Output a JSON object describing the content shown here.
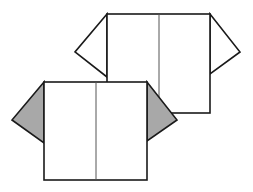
{
  "diagram": {
    "colors": {
      "stroke": "#1a1a1a",
      "fold_line": "#555555",
      "paper_front": "#ffffff",
      "paper_back": "#a8a8a8",
      "background": "#ffffff"
    },
    "back_shape": {
      "body": {
        "x": 107,
        "y": 14,
        "w": 103,
        "h": 99
      },
      "center_fold_x": 159,
      "left_sleeve": {
        "top": [
          107,
          14
        ],
        "tip": [
          75,
          52
        ],
        "bottom": [
          107,
          77
        ]
      },
      "right_sleeve": {
        "top": [
          210,
          14
        ],
        "tip": [
          240,
          52
        ],
        "bottom": [
          210,
          74
        ]
      }
    },
    "front_shape": {
      "body": {
        "x": 44,
        "y": 82,
        "w": 103,
        "h": 98
      },
      "center_fold_x": 96,
      "left_sleeve": {
        "top": [
          44,
          82
        ],
        "tip": [
          12,
          120
        ],
        "bottom": [
          44,
          143
        ]
      },
      "right_sleeve": {
        "top": [
          147,
          82
        ],
        "tip": [
          177,
          120
        ],
        "bottom": [
          147,
          141
        ]
      }
    }
  }
}
